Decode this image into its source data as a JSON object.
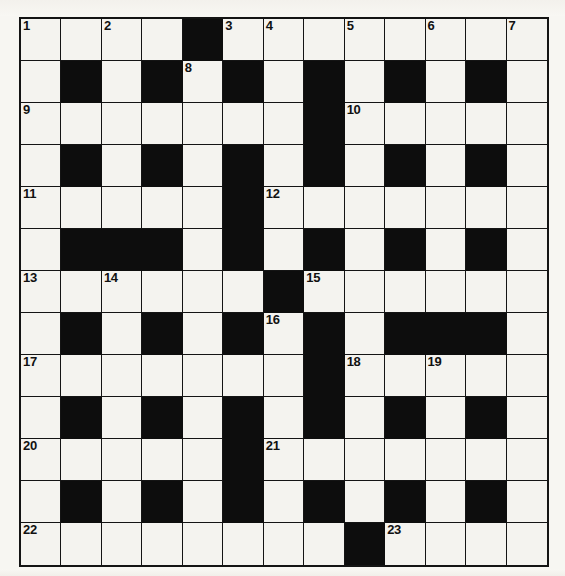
{
  "puzzle": {
    "title": "Crossword Grid",
    "kind": "crossword-grid",
    "rows": 13,
    "columns": 13,
    "colors": {
      "page_background": "#f7f6f2",
      "cell_fill": "#f4f3ef",
      "block_fill": "#0d0d0d",
      "grid_line": "#141414",
      "number_text": "#111111"
    },
    "legend": {
      "open_cell": "white letter cell",
      "blocked_cell": "black square"
    },
    "grid": [
      [
        "open",
        "open",
        "open",
        "open",
        "block",
        "open",
        "open",
        "open",
        "open",
        "open",
        "open",
        "open",
        "open"
      ],
      [
        "open",
        "block",
        "open",
        "block",
        "open",
        "block",
        "open",
        "block",
        "open",
        "block",
        "open",
        "block",
        "open"
      ],
      [
        "open",
        "open",
        "open",
        "open",
        "open",
        "open",
        "open",
        "block",
        "open",
        "open",
        "open",
        "open",
        "open"
      ],
      [
        "open",
        "block",
        "open",
        "block",
        "open",
        "block",
        "open",
        "block",
        "open",
        "block",
        "open",
        "block",
        "open"
      ],
      [
        "open",
        "open",
        "open",
        "open",
        "open",
        "block",
        "open",
        "open",
        "open",
        "open",
        "open",
        "open",
        "open"
      ],
      [
        "open",
        "block",
        "block",
        "block",
        "open",
        "block",
        "open",
        "block",
        "open",
        "block",
        "open",
        "block",
        "open"
      ],
      [
        "open",
        "open",
        "open",
        "open",
        "open",
        "open",
        "block",
        "open",
        "open",
        "open",
        "open",
        "open",
        "open"
      ],
      [
        "open",
        "block",
        "open",
        "block",
        "open",
        "block",
        "open",
        "block",
        "open",
        "block",
        "block",
        "block",
        "open"
      ],
      [
        "open",
        "open",
        "open",
        "open",
        "open",
        "open",
        "open",
        "block",
        "open",
        "open",
        "open",
        "open",
        "open"
      ],
      [
        "open",
        "block",
        "open",
        "block",
        "open",
        "block",
        "open",
        "block",
        "open",
        "block",
        "open",
        "block",
        "open"
      ],
      [
        "open",
        "open",
        "open",
        "open",
        "open",
        "block",
        "open",
        "open",
        "open",
        "open",
        "open",
        "open",
        "open"
      ],
      [
        "open",
        "block",
        "open",
        "block",
        "open",
        "block",
        "open",
        "block",
        "open",
        "block",
        "open",
        "block",
        "open"
      ],
      [
        "open",
        "open",
        "open",
        "open",
        "open",
        "open",
        "open",
        "open",
        "block",
        "open",
        "open",
        "open",
        "open"
      ]
    ],
    "numbers": [
      {
        "n": "1",
        "row": 0,
        "col": 0
      },
      {
        "n": "2",
        "row": 0,
        "col": 2
      },
      {
        "n": "3",
        "row": 0,
        "col": 5
      },
      {
        "n": "4",
        "row": 0,
        "col": 6
      },
      {
        "n": "5",
        "row": 0,
        "col": 8
      },
      {
        "n": "6",
        "row": 0,
        "col": 10
      },
      {
        "n": "7",
        "row": 0,
        "col": 12
      },
      {
        "n": "8",
        "row": 1,
        "col": 4
      },
      {
        "n": "9",
        "row": 2,
        "col": 0
      },
      {
        "n": "10",
        "row": 2,
        "col": 8
      },
      {
        "n": "11",
        "row": 4,
        "col": 0
      },
      {
        "n": "12",
        "row": 4,
        "col": 6
      },
      {
        "n": "13",
        "row": 6,
        "col": 0
      },
      {
        "n": "14",
        "row": 6,
        "col": 2
      },
      {
        "n": "15",
        "row": 6,
        "col": 7
      },
      {
        "n": "16",
        "row": 7,
        "col": 6
      },
      {
        "n": "17",
        "row": 8,
        "col": 0
      },
      {
        "n": "18",
        "row": 8,
        "col": 8
      },
      {
        "n": "19",
        "row": 8,
        "col": 10
      },
      {
        "n": "20",
        "row": 10,
        "col": 0
      },
      {
        "n": "21",
        "row": 10,
        "col": 6
      },
      {
        "n": "22",
        "row": 12,
        "col": 0
      },
      {
        "n": "23",
        "row": 12,
        "col": 9
      }
    ]
  }
}
